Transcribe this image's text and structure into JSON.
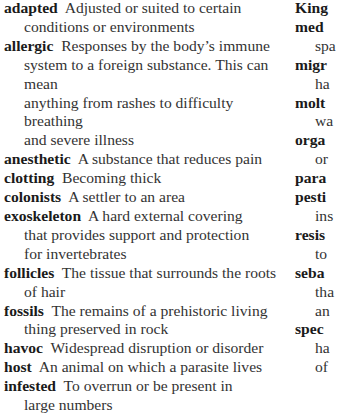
{
  "glossary": {
    "left_column": [
      {
        "term": "adapted",
        "lines": [
          "Adjusted or suited to certain",
          "conditions or environments"
        ]
      },
      {
        "term": "allergic",
        "lines": [
          "Responses by the body’s immune",
          "system to a foreign substance. This can mean",
          "anything from rashes to difficulty breathing",
          "and severe illness"
        ]
      },
      {
        "term": "anesthetic",
        "lines": [
          "A substance that reduces pain"
        ]
      },
      {
        "term": "clotting",
        "lines": [
          "Becoming thick"
        ]
      },
      {
        "term": "colonists",
        "lines": [
          "A settler to an area"
        ]
      },
      {
        "term": "exoskeleton",
        "lines": [
          "A hard external covering",
          "that provides support and protection",
          "for invertebrates"
        ]
      },
      {
        "term": "follicles",
        "lines": [
          "The tissue that surrounds the roots",
          "of hair"
        ]
      },
      {
        "term": "fossils",
        "lines": [
          "The remains of a prehistoric living",
          "thing preserved in rock"
        ]
      },
      {
        "term": "havoc",
        "lines": [
          "Widespread disruption or disorder"
        ]
      },
      {
        "term": "host",
        "lines": [
          "An animal on which a parasite lives"
        ]
      },
      {
        "term": "infested",
        "lines": [
          "To overrun or be present in",
          "large numbers"
        ]
      }
    ],
    "right_column": [
      {
        "term": "King",
        "lines": []
      },
      {
        "term": "med",
        "lines": [
          "",
          "spa"
        ]
      },
      {
        "term": "migr",
        "lines": [
          "",
          "ha"
        ]
      },
      {
        "term": "molt",
        "lines": [
          "",
          "wa"
        ]
      },
      {
        "term": "orga",
        "lines": [
          "",
          "or"
        ]
      },
      {
        "term": "para",
        "lines": []
      },
      {
        "term": "pesti",
        "lines": [
          "",
          "ins"
        ]
      },
      {
        "term": "resis",
        "lines": [
          "",
          "to"
        ]
      },
      {
        "term": "seba",
        "lines": [
          "",
          "tha",
          "an"
        ]
      },
      {
        "term": "spec",
        "lines": [
          "",
          "ha",
          "of"
        ]
      }
    ]
  }
}
